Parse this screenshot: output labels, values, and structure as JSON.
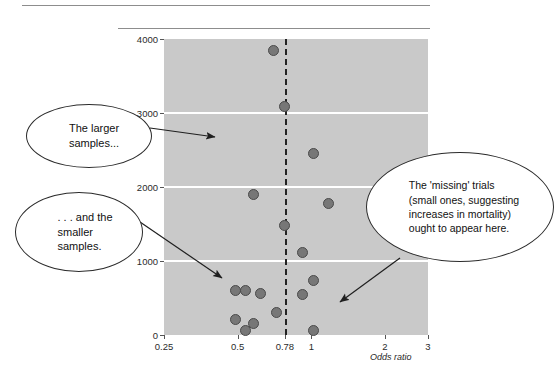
{
  "figure": {
    "rules": [
      "top-rule",
      "second-rule"
    ]
  },
  "axes": {
    "y_label": "No of patients",
    "x_label": "Odds ratio",
    "y_ticks": [
      "0",
      "1000",
      "2000",
      "3000",
      "4000"
    ],
    "x_ticks": [
      "0.25",
      "0.5",
      "0.78",
      "1",
      "2",
      "3"
    ]
  },
  "callouts": {
    "larger": "The larger\nsamples...",
    "smaller": ". . . and the\nsmaller\nsamples.",
    "missing": "The 'missing' trials\n(small ones, suggesting\nincreases in mortality)\nought to appear here."
  },
  "colors": {
    "plot_background": "#c9c9c9",
    "gridline": "#ffffff",
    "marker_fill": "#777777",
    "marker_edge": "#4a4a4a",
    "reference_line": "#222222",
    "text": "#1f1f1f"
  },
  "chart_data": {
    "type": "scatter",
    "title": "",
    "xlabel": "Odds ratio",
    "ylabel": "No of patients",
    "xscale": "log",
    "xlim": [
      0.25,
      3
    ],
    "ylim": [
      0,
      4000
    ],
    "xticks": [
      0.25,
      0.5,
      0.78,
      1,
      2,
      3
    ],
    "yticks": [
      0,
      1000,
      2000,
      3000,
      4000
    ],
    "grid": "horizontal gridlines at 1000, 2000, 3000",
    "legend": "none",
    "reference_line": {
      "x": 0.78,
      "style": "dashed vertical",
      "label": "0.78"
    },
    "points": [
      {
        "odds_ratio": 0.7,
        "patients": 3850
      },
      {
        "odds_ratio": 0.78,
        "patients": 3090
      },
      {
        "odds_ratio": 1.02,
        "patients": 2450
      },
      {
        "odds_ratio": 0.58,
        "patients": 1900
      },
      {
        "odds_ratio": 1.18,
        "patients": 1780
      },
      {
        "odds_ratio": 0.78,
        "patients": 1480
      },
      {
        "odds_ratio": 0.92,
        "patients": 1120
      },
      {
        "odds_ratio": 1.02,
        "patients": 740
      },
      {
        "odds_ratio": 0.49,
        "patients": 600
      },
      {
        "odds_ratio": 0.54,
        "patients": 600
      },
      {
        "odds_ratio": 0.62,
        "patients": 560
      },
      {
        "odds_ratio": 0.92,
        "patients": 545
      },
      {
        "odds_ratio": 0.72,
        "patients": 310
      },
      {
        "odds_ratio": 0.49,
        "patients": 210
      },
      {
        "odds_ratio": 0.58,
        "patients": 160
      },
      {
        "odds_ratio": 0.54,
        "patients": 60
      },
      {
        "odds_ratio": 1.02,
        "patients": 55
      }
    ],
    "annotations": [
      {
        "text": "The larger samples...",
        "points_to": "upper region of plot"
      },
      {
        "text": ". . . and the smaller samples.",
        "points_to": "lower-left cluster"
      },
      {
        "text": "The 'missing' trials (small ones, suggesting increases in mortality) ought to appear here.",
        "points_to": "lower-right region"
      }
    ]
  }
}
